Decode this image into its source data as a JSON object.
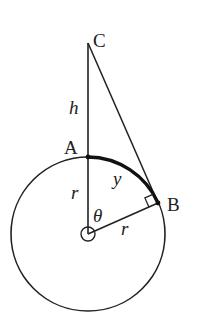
{
  "diagram": {
    "colors": {
      "stroke": "#222222",
      "background": "#ffffff"
    },
    "geometry": {
      "center": [
        88,
        234
      ],
      "radius": 77,
      "A": [
        88,
        157
      ],
      "B": [
        158,
        203
      ],
      "C": [
        88,
        43
      ]
    },
    "labels": {
      "C": "C",
      "A": "A",
      "B": "B",
      "h": "h",
      "r_vertical": "r",
      "r_radius": "r",
      "y": "y",
      "theta": "θ"
    }
  }
}
